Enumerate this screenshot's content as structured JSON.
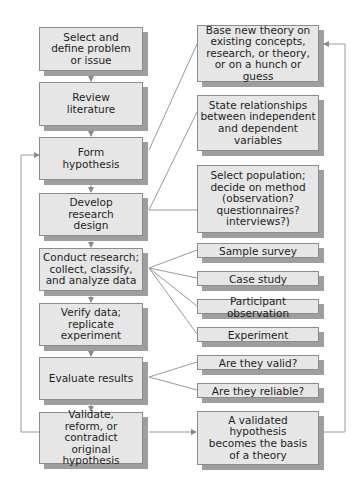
{
  "diagram": {
    "type": "flowchart",
    "main_steps": [
      {
        "id": "s1",
        "label": "Select and\ndefine problem\nor issue"
      },
      {
        "id": "s2",
        "label": "Review\nliterature"
      },
      {
        "id": "s3",
        "label": "Form\nhypothesis"
      },
      {
        "id": "s4",
        "label": "Develop\nresearch\ndesign"
      },
      {
        "id": "s5",
        "label": "Conduct research;\ncollect, classify,\nand analyze data"
      },
      {
        "id": "s6",
        "label": "Verify data;\nreplicate experiment"
      },
      {
        "id": "s7",
        "label": "Evaluate results"
      },
      {
        "id": "s8",
        "label": "Validate,\nreform, or\ncontradict\noriginal hypothesis"
      }
    ],
    "side_notes": [
      {
        "id": "n1",
        "attached_to": "s3",
        "label": "Base new theory on\nexisting concepts,\nresearch, or theory,\nor on a hunch or guess"
      },
      {
        "id": "n2",
        "attached_to": "s3",
        "label": "State relationships\nbetween independent\nand dependent\nvariables"
      },
      {
        "id": "n3",
        "attached_to": "s4",
        "label": "Select population;\ndecide on method\n(observation?\nquestionnaires?\ninterviews?)"
      },
      {
        "id": "m1",
        "attached_to": "s5",
        "label": "Sample survey"
      },
      {
        "id": "m2",
        "attached_to": "s5",
        "label": "Case study"
      },
      {
        "id": "m3",
        "attached_to": "s5",
        "label": "Participant observation"
      },
      {
        "id": "m4",
        "attached_to": "s5",
        "label": "Experiment"
      },
      {
        "id": "e1",
        "attached_to": "s7",
        "label": "Are they valid?"
      },
      {
        "id": "e2",
        "attached_to": "s7",
        "label": "Are they reliable?"
      },
      {
        "id": "t1",
        "attached_to": "s8",
        "label": "A validated\nhypothesis\nbecomes the basis\nof a theory"
      }
    ],
    "flows": [
      {
        "from": "s1",
        "to": "s2"
      },
      {
        "from": "s2",
        "to": "s3"
      },
      {
        "from": "s3",
        "to": "s4"
      },
      {
        "from": "s4",
        "to": "s5"
      },
      {
        "from": "s5",
        "to": "s6"
      },
      {
        "from": "s6",
        "to": "s7"
      },
      {
        "from": "s7",
        "to": "s8"
      },
      {
        "from": "s8",
        "to": "s3",
        "note": "feedback loop on left"
      },
      {
        "from": "s8",
        "to": "t1"
      },
      {
        "from": "t1",
        "to": "n1",
        "note": "feedback loop on right"
      }
    ],
    "colors": {
      "box_fill": "#e6e6e6",
      "box_border": "#8c8c8c",
      "shadow": "#9e9e9e",
      "line": "#9a9a9a"
    }
  }
}
